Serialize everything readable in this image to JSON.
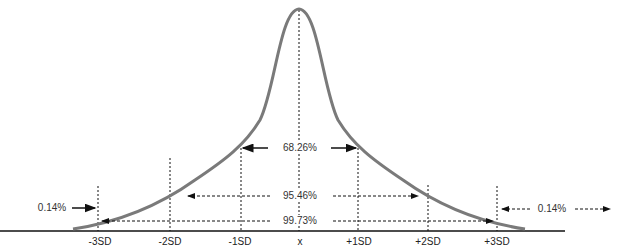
{
  "diagram": {
    "type": "normal-distribution",
    "x_labels": [
      "-3SD",
      "-2SD",
      "-1SD",
      "x",
      "+1SD",
      "+2SD",
      "+3SD"
    ],
    "ranges": {
      "one_sd": "68.26%",
      "two_sd": "95.46%",
      "three_sd": "99.73%"
    },
    "tails": {
      "left": "0.14%",
      "right": "0.14%"
    },
    "colors": {
      "curve": "#7a7a7a",
      "lines": "#111111",
      "text": "#333333"
    }
  }
}
